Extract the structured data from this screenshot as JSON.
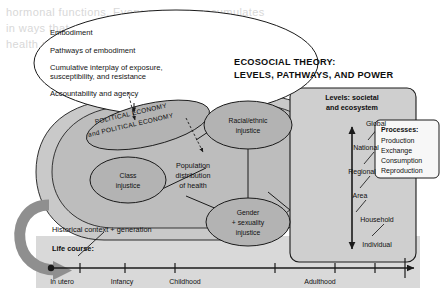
{
  "figure": {
    "title_line1": "ECOSOCIAL THEORY:",
    "title_line2": "LEVELS, PATHWAYS, AND POWER"
  },
  "embodiment_ellipse": {
    "items": [
      "Embodiment",
      "Pathways of embodiment",
      "Cumulative interplay of exposure,",
      "susceptibility, and resistance",
      "Accountability and agency"
    ]
  },
  "political_economy_ellipse": {
    "line1": "POLITICAL ECONOMY",
    "line2": "and POLITICAL ECONOMY"
  },
  "nodes": {
    "racial": {
      "line1": "Racial/ethnic",
      "line2": "injustice"
    },
    "class": {
      "line1": "Class",
      "line2": "injustice"
    },
    "gender": {
      "line1": "Gender",
      "line2": "+ sexuality",
      "line3": "injustice"
    },
    "population": {
      "line1": "Population",
      "line2": "distribution",
      "line3": "of health"
    }
  },
  "levels_box": {
    "heading_line1": "Levels: societal",
    "heading_line2": "and ecosystem",
    "levels": [
      "Global",
      "National",
      "Regional",
      "Area",
      "Household",
      "Individual"
    ]
  },
  "processes_box": {
    "heading": "Processes:",
    "items": [
      "Production",
      "Exchange",
      "Consumption",
      "Reproduction"
    ]
  },
  "historical": {
    "label": "Historical context + generation"
  },
  "life_course": {
    "label": "Life course:",
    "stages": [
      "In utero",
      "Infancy",
      "Childhood",
      "Adulthood"
    ]
  },
  "ghost_text": {
    "rows": [
      "hormonal functions. Every exposure accumulates",
      "in ways that shape acute vulnerability, altering",
      "health across the whole of the life course and"
    ]
  },
  "colors": {
    "page_background": "#ffffff",
    "panel_gray": "#d9d9d9",
    "outer_blob": "#c9c9c9",
    "inner_blob": "#bdbdbd",
    "node_fill": "#b3b3b3",
    "box_fill": "#cfcfcf",
    "white_box": "#f7f7f7",
    "stroke": "#1a1a1a",
    "arrow_gray": "#8f8f8f"
  }
}
